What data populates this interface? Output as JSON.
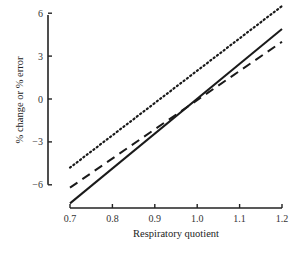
{
  "chart_data": {
    "type": "line",
    "title": "",
    "xlabel": "Respiratory quotient",
    "ylabel": "% change or % error",
    "xlim": [
      0.7,
      1.2
    ],
    "ylim": [
      -7.3,
      6.5
    ],
    "x_ticks": [
      0.7,
      0.8,
      0.9,
      1.0,
      1.1,
      1.2
    ],
    "x_tick_labels": [
      "0.7",
      "0.8",
      "0.9",
      "1.0",
      "1.1",
      "1.2"
    ],
    "y_ticks": [
      6,
      3,
      0,
      -3,
      -6
    ],
    "y_tick_labels": [
      "6",
      "3",
      "0",
      "−3",
      "−6"
    ],
    "grid": false,
    "legend": null,
    "x": [
      0.7,
      1.2
    ],
    "series": [
      {
        "name": "dotted",
        "style": "dotted",
        "values": [
          -4.8,
          6.5
        ]
      },
      {
        "name": "solid",
        "style": "solid",
        "values": [
          -7.3,
          4.9
        ]
      },
      {
        "name": "dashed",
        "style": "dashed",
        "values": [
          -6.2,
          4.0
        ]
      }
    ],
    "colors": {
      "line": "#1a1a1a",
      "axis": "#222222",
      "background": "#ffffff"
    }
  }
}
